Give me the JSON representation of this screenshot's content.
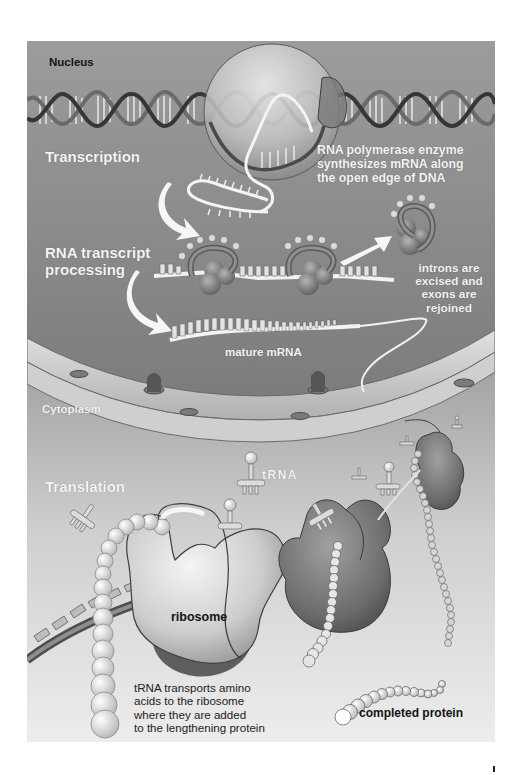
{
  "figure": {
    "colors": {
      "nucleus_bg": "#9a9a9a",
      "nucleus_bg_lower": "#7f7f7f",
      "cytoplasm_top": "#5e5e5e",
      "cytoplasm_bottom": "#ececec",
      "membrane": "#d6d6d6",
      "dna_strand_dark": "#3a3a3a",
      "dna_strand_mid": "#6a6a6a",
      "rna": "#f2f2f2",
      "ribosome_light": "#d8d8d8",
      "ribosome_dark": "#6e6e6e",
      "label_light": "#f4f4f4",
      "label_dark": "#141414"
    }
  },
  "regions": {
    "nucleus": {
      "label": "Nucleus"
    },
    "cytoplasm": {
      "label": "Cytoplasm"
    }
  },
  "stages": {
    "transcription": {
      "label": "Transcription"
    },
    "processing": {
      "label": "RNA transcript\nprocessing"
    },
    "translation": {
      "label": "Translation"
    }
  },
  "annotations": {
    "rna_polymerase": "RNA polymerase enzyme\nsynthesizes mRNA along\nthe open edge of DNA",
    "introns": "introns are\nexcised and\nexons are\nrejoined",
    "mature_mrna": "mature mRNA",
    "trna": "tRNA",
    "ribosome": "ribosome",
    "trna_transport": "tRNA transports amino\nacids to the ribosome\nwhere they are added\nto the lengthening protein",
    "completed_protein": "completed protein"
  },
  "page_mark": "ı"
}
